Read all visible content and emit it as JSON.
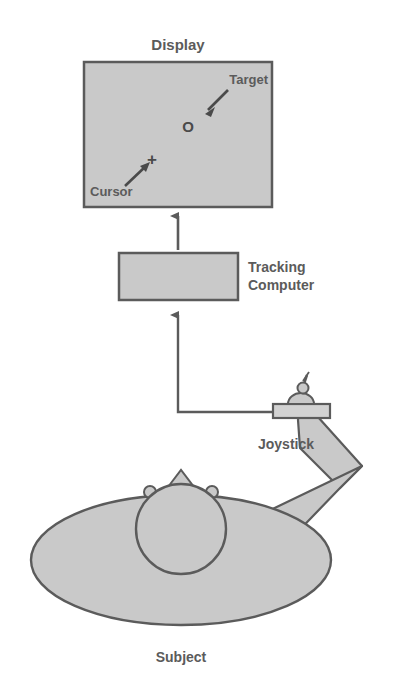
{
  "figure": {
    "background_color": "#ffffff",
    "fill_color": "#c9c9c9",
    "stroke_color": "#5b5b5b",
    "text_color": "#5b5b5b"
  },
  "display": {
    "label": "Display",
    "target_label": "Target",
    "cursor_label": "Cursor",
    "target_glyph": "O",
    "cursor_glyph": "+"
  },
  "tracking_computer": {
    "label_line1": "Tracking",
    "label_line2": "Computer"
  },
  "joystick": {
    "label": "Joystick"
  },
  "subject": {
    "label": "Subject"
  }
}
